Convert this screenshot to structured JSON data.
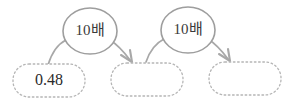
{
  "diagram": {
    "type": "flow",
    "background_color": "#ffffff",
    "stroke_color": "#a3a3a3",
    "text_color": "#2b2b2b",
    "boxes": [
      {
        "id": "box-1",
        "label": "0.48",
        "empty": false
      },
      {
        "id": "box-2",
        "label": "",
        "empty": true
      },
      {
        "id": "box-3",
        "label": "",
        "empty": true
      }
    ],
    "operations": [
      {
        "id": "op-1",
        "label": "10배"
      },
      {
        "id": "op-2",
        "label": "10배"
      }
    ],
    "arrows": [
      {
        "id": "arrow-1",
        "from": "box-1",
        "to": "box-2",
        "via": "op-1"
      },
      {
        "id": "arrow-2",
        "from": "box-2",
        "to": "box-3",
        "via": "op-2"
      }
    ]
  }
}
